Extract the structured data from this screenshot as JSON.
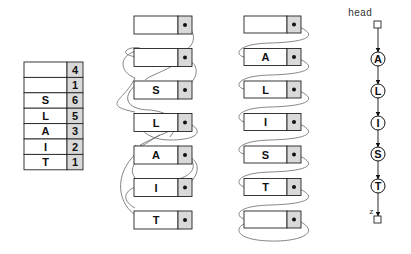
{
  "colors": {
    "stroke": "#222222",
    "cell_shade": "#d9d9d9",
    "link": "#555555",
    "background": "#ffffff"
  },
  "index_table": {
    "rows": [
      {
        "key": "",
        "index": "4"
      },
      {
        "key": "",
        "index": "1"
      },
      {
        "key": "S",
        "index": "6"
      },
      {
        "key": "L",
        "index": "5"
      },
      {
        "key": "A",
        "index": "3"
      },
      {
        "key": "I",
        "index": "2"
      },
      {
        "key": "T",
        "index": "1"
      }
    ]
  },
  "unsorted_list": {
    "nodes": [
      {
        "key": ""
      },
      {
        "key": ""
      },
      {
        "key": "S"
      },
      {
        "key": "L"
      },
      {
        "key": "A"
      },
      {
        "key": "I"
      },
      {
        "key": "T"
      }
    ]
  },
  "sorted_array_list": {
    "nodes": [
      {
        "key": ""
      },
      {
        "key": "A"
      },
      {
        "key": "L"
      },
      {
        "key": "I"
      },
      {
        "key": "S"
      },
      {
        "key": "T"
      },
      {
        "key": ""
      }
    ]
  },
  "linked_list": {
    "head_label": "head",
    "tail_label": "z",
    "nodes": [
      {
        "key": "A"
      },
      {
        "key": "L"
      },
      {
        "key": "I"
      },
      {
        "key": "S"
      },
      {
        "key": "T"
      }
    ]
  }
}
